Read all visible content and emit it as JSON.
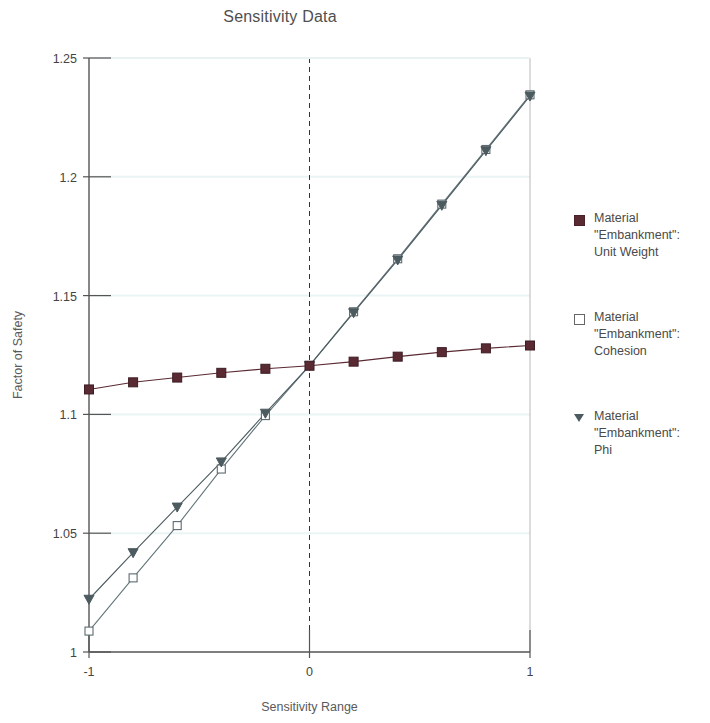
{
  "chart_data": {
    "type": "line",
    "title": "Sensitivity Data",
    "xlabel": "Sensitivity Range",
    "ylabel": "Factor of Safety",
    "xlim": [
      -1,
      1
    ],
    "ylim": [
      1,
      1.25
    ],
    "xticks": [
      -1,
      0,
      1
    ],
    "xtick_labels": [
      "-1",
      "0",
      "1"
    ],
    "yticks": [
      1,
      1.05,
      1.1,
      1.15,
      1.2,
      1.25
    ],
    "ytick_labels": [
      "1",
      "1.05",
      "1.1",
      "1.15",
      "1.2",
      "1.25"
    ],
    "grid": true,
    "legend_position": "right",
    "reference_line_x": 0,
    "x": [
      -1,
      -0.8,
      -0.6,
      -0.4,
      -0.2,
      0,
      0.2,
      0.4,
      0.6,
      0.8,
      1
    ],
    "series": [
      {
        "name": "Material \"Embankment\": Unit Weight",
        "marker": "filled-square",
        "color": "#5a2a33",
        "values": [
          1.1105,
          1.1135,
          1.1155,
          1.1175,
          1.1192,
          1.1205,
          1.1222,
          1.1243,
          1.1262,
          1.1278,
          1.129
        ]
      },
      {
        "name": "Material \"Embankment\": Cohesion",
        "marker": "open-square",
        "color": "#63757b",
        "values": [
          1.0088,
          1.0312,
          1.0532,
          1.077,
          1.0995,
          1.1205,
          1.1432,
          1.1655,
          1.1885,
          1.2115,
          1.2345
        ]
      },
      {
        "name": "Material \"Embankment\": Phi",
        "marker": "triangle-down",
        "color": "#4c5b60",
        "values": [
          1.0222,
          1.0418,
          1.061,
          1.08,
          1.1005,
          1.1205,
          1.1428,
          1.165,
          1.188,
          1.211,
          1.234
        ]
      }
    ]
  },
  "legend": {
    "entries": [
      {
        "line1": "Material",
        "line2": "\"Embankment\":",
        "line3": "Unit Weight",
        "marker": "filled-square-icon"
      },
      {
        "line1": "Material",
        "line2": "\"Embankment\":",
        "line3": "Cohesion",
        "marker": "open-square-icon"
      },
      {
        "line1": "Material",
        "line2": "\"Embankment\":",
        "line3": "Phi",
        "marker": "triangle-down-icon"
      }
    ]
  },
  "colors": {
    "unit_weight": "#5a2a33",
    "cohesion": "#63757b",
    "phi": "#4c5b60",
    "axis": "#555555",
    "grid": "#eaf4f4",
    "background": "#ffffff"
  }
}
